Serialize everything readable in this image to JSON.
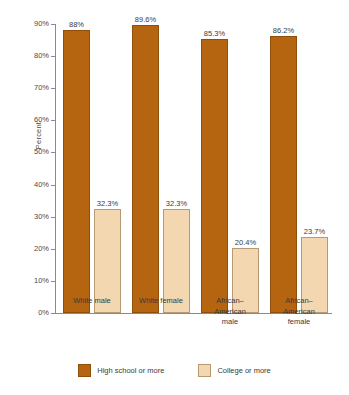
{
  "chart_data": {
    "type": "bar",
    "title": "",
    "xlabel": "",
    "ylabel": "Percent",
    "ylim": [
      0,
      90
    ],
    "grid": false,
    "legend_position": "bottom-center",
    "categories": [
      "White male",
      "White female",
      "African–American male",
      "African–American female"
    ],
    "category_lines": [
      [
        "White male"
      ],
      [
        "White female"
      ],
      [
        "African–",
        "American",
        "male"
      ],
      [
        "African–",
        "American",
        "female"
      ]
    ],
    "y_ticks": [
      0,
      10,
      20,
      30,
      40,
      50,
      60,
      70,
      80,
      90
    ],
    "y_tick_labels": [
      "0%",
      "10%",
      "20%",
      "30%",
      "40%",
      "50%",
      "60%",
      "70%",
      "80%",
      "90%"
    ],
    "series": [
      {
        "name": "High school or more",
        "color": "#b5650f",
        "values": [
          88,
          89.6,
          85.3,
          86.2
        ],
        "labels": [
          "88%",
          "89.6%",
          "85.3%",
          "86.2%"
        ]
      },
      {
        "name": "College or more",
        "color": "#f2d7b0",
        "values": [
          32.3,
          32.3,
          20.4,
          23.7
        ],
        "labels": [
          "32.3%",
          "32.3%",
          "20.4%",
          "23.7%"
        ]
      }
    ]
  },
  "legend": {
    "items": [
      {
        "label": "High school or more",
        "color": "#b5650f"
      },
      {
        "label": "College or more",
        "color": "#f2d7b0"
      }
    ]
  }
}
